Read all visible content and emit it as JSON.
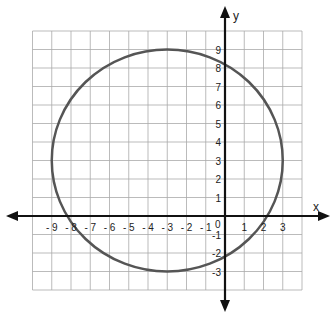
{
  "chart_data": {
    "type": "line",
    "title": "",
    "xlabel": "x",
    "ylabel": "y",
    "xlim": [
      -10,
      4
    ],
    "ylim": [
      -4,
      10
    ],
    "grid": true,
    "x_ticks": [
      "-9",
      "-8",
      "-7",
      "-6",
      "-5",
      "-4",
      "-3",
      "-2",
      "-1",
      "1",
      "2",
      "3"
    ],
    "y_ticks": [
      "9",
      "8",
      "7",
      "6",
      "5",
      "4",
      "3",
      "2",
      "1",
      "-1",
      "-2",
      "-3"
    ],
    "origin_label": "0",
    "series": [
      {
        "name": "circle",
        "shape": "circle",
        "center": [
          -3,
          3
        ],
        "radius": 6,
        "color": "#555555",
        "equation": "(x+3)^2 + (y-3)^2 = 36",
        "x_intercepts": [
          -8.2,
          2.2
        ],
        "y_intercepts": [
          -2,
          8
        ]
      }
    ]
  }
}
